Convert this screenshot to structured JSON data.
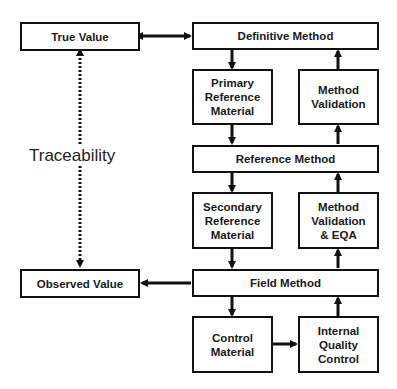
{
  "diagram": {
    "nodes": {
      "true_value": "True Value",
      "definitive_method": "Definitive Method",
      "primary_reference_material": "Primary\nReference\nMaterial",
      "method_validation": "Method\nValidation",
      "reference_method": "Reference Method",
      "secondary_reference_material": "Secondary\nReference\nMaterial",
      "method_validation_eqa": "Method\nValidation\n& EQA",
      "observed_value": "Observed Value",
      "field_method": "Field Method",
      "control_material": "Control\nMaterial",
      "internal_quality_control": "Internal\nQuality\nControl"
    },
    "traceability_label": "Traceability",
    "edges": [
      {
        "from": "true_value",
        "to": "definitive_method",
        "style": "bidirectional"
      },
      {
        "from": "definitive_method",
        "to": "primary_reference_material",
        "style": "solid"
      },
      {
        "from": "method_validation",
        "to": "definitive_method",
        "style": "solid"
      },
      {
        "from": "primary_reference_material",
        "to": "reference_method",
        "style": "solid"
      },
      {
        "from": "reference_method",
        "to": "method_validation",
        "style": "solid"
      },
      {
        "from": "reference_method",
        "to": "secondary_reference_material",
        "style": "solid"
      },
      {
        "from": "method_validation_eqa",
        "to": "reference_method",
        "style": "solid"
      },
      {
        "from": "secondary_reference_material",
        "to": "field_method",
        "style": "solid"
      },
      {
        "from": "field_method",
        "to": "method_validation_eqa",
        "style": "solid"
      },
      {
        "from": "field_method",
        "to": "observed_value",
        "style": "solid"
      },
      {
        "from": "field_method",
        "to": "control_material",
        "style": "solid"
      },
      {
        "from": "control_material",
        "to": "internal_quality_control",
        "style": "solid"
      },
      {
        "from": "internal_quality_control",
        "to": "field_method",
        "style": "solid"
      },
      {
        "from": "true_value",
        "to": "observed_value",
        "style": "dotted-bidirectional",
        "label": "Traceability"
      }
    ]
  }
}
